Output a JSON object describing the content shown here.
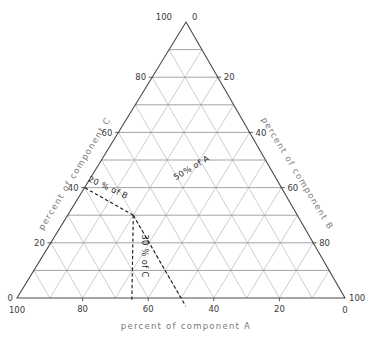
{
  "chart_data": {
    "type": "ternary",
    "title": "",
    "axes": [
      {
        "id": "A",
        "title": "percent of component A",
        "position": "bottom",
        "ticks": [
          "100",
          "80",
          "60",
          "40",
          "20",
          "0"
        ],
        "tick_values": [
          100,
          80,
          60,
          40,
          20,
          0
        ],
        "range": [
          0,
          100
        ],
        "direction": "right-to-left"
      },
      {
        "id": "B",
        "title": "percent of component B",
        "position": "right",
        "ticks": [
          "20",
          "40",
          "60",
          "80"
        ],
        "tick_values": [
          20,
          40,
          60,
          80
        ],
        "range": [
          0,
          100
        ],
        "direction": "top-to-bottom"
      },
      {
        "id": "C",
        "title": "percent of component C",
        "position": "left",
        "ticks": [
          "20",
          "40",
          "60",
          "80"
        ],
        "tick_values": [
          20,
          40,
          60,
          80
        ],
        "range": [
          0,
          100
        ],
        "direction": "bottom-to-top"
      }
    ],
    "corner_labels": {
      "apex_left": "100",
      "apex_right": "0",
      "bottom_left_upper": "0",
      "bottom_left_lower": "100",
      "bottom_right_upper": "100",
      "bottom_right_lower": "0"
    },
    "grid": {
      "on": true,
      "interval": 10,
      "horizontal_color": "#8d8d8d",
      "diagonal_color": "#b4b4b4",
      "outline_color": "#4a4a4a"
    },
    "legend": {
      "position": "none",
      "entries": []
    },
    "annotations": [
      {
        "id": "a-line",
        "label": "50% of A",
        "value": 50,
        "component": "A",
        "style": "dashed",
        "color": "#1f1f1f"
      },
      {
        "id": "b-line",
        "label": "20 % of B",
        "value": 20,
        "component": "B",
        "style": "dashed",
        "color": "#1f1f1f"
      },
      {
        "id": "c-line",
        "label": "30 % of C",
        "value": 30,
        "component": "C",
        "style": "dashed",
        "color": "#1f1f1f"
      }
    ],
    "points": [
      {
        "id": "construction-point",
        "A": 50,
        "B": 20,
        "C": 30
      }
    ]
  },
  "chart": {
    "axis_a_title": "percent of component A",
    "axis_b_title": "percent of component B",
    "axis_c_title": "percent of component C",
    "corner_apex_left": "100",
    "corner_apex_right": "0",
    "corner_bl_upper": "0",
    "corner_bl_lower": "100",
    "corner_br_upper": "100",
    "corner_br_lower": "0",
    "bottom_ticks": [
      "100",
      "80",
      "60",
      "40",
      "20",
      "0"
    ],
    "left_ticks": [
      "20",
      "40",
      "60",
      "80"
    ],
    "right_ticks": [
      "20",
      "40",
      "60",
      "80"
    ],
    "annot_a": "50% of A",
    "annot_b": "20 % of B",
    "annot_c": "30 % of C"
  }
}
